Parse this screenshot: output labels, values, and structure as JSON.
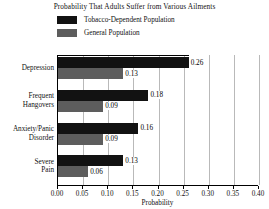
{
  "chart_data": {
    "type": "bar",
    "orientation": "horizontal",
    "title": "Probability That Adults Suffer from Various Ailments",
    "xlabel": "Probability",
    "ylabel": "",
    "xlim": [
      0.0,
      0.4
    ],
    "xticks": [
      "0.00",
      "0.05",
      "0.10",
      "0.15",
      "0.20",
      "0.25",
      "0.30",
      "0.35",
      "0.40"
    ],
    "xtick_values": [
      0.0,
      0.05,
      0.1,
      0.15,
      0.2,
      0.25,
      0.3,
      0.35,
      0.4
    ],
    "grid": "vertical",
    "legend_position": "above-plot-left",
    "categories": [
      "Depression",
      "Frequent Hangovers",
      "Anxiety/Panic Disorder",
      "Severe Pain"
    ],
    "series": [
      {
        "name": "Tobacco-Dependent Population",
        "color": "#121212",
        "values": [
          0.26,
          0.18,
          0.16,
          0.13
        ],
        "labels": [
          "0.26",
          "0.18",
          "0.16",
          "0.13"
        ]
      },
      {
        "name": "General Population",
        "color": "#5d5d5d",
        "values": [
          0.13,
          0.09,
          0.09,
          0.06
        ],
        "labels": [
          "0.13",
          "0.09",
          "0.09",
          "0.06"
        ]
      }
    ]
  },
  "legend": {
    "items": [
      {
        "label": "Tobacco-Dependent Population",
        "color": "#121212"
      },
      {
        "label": "General Population",
        "color": "#5d5d5d"
      }
    ]
  },
  "categories_multiline": [
    [
      "Depression"
    ],
    [
      "Frequent",
      "Hangovers"
    ],
    [
      "Anxiety/Panic",
      "Disorder"
    ],
    [
      "Severe",
      "Pain"
    ]
  ]
}
